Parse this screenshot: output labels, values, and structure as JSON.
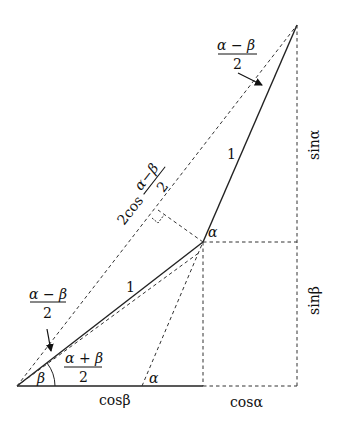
{
  "diagram": {
    "type": "trigonometric-sum-to-product",
    "points": {
      "origin": [
        17,
        386
      ],
      "mid": [
        203,
        242
      ],
      "top": [
        297,
        25
      ],
      "foot_mid": [
        203,
        386
      ],
      "foot_top": [
        297,
        386
      ],
      "alpha_foot": [
        142,
        386
      ],
      "right_angle": [
        158,
        218
      ]
    },
    "labels": {
      "seg_one_lower": "1",
      "seg_one_upper": "1",
      "beta": "β",
      "alpha_mid": "α",
      "alpha_base": "α",
      "cos_beta": "cosβ",
      "cos_alpha": "cosα",
      "sin_alpha": "sinα",
      "sin_beta": "sinβ",
      "two_cos": "2cos",
      "frac_amb_num": "α − β",
      "frac_den": "2",
      "frac_apb_num": "α + β",
      "top_frac_num": "α − β",
      "top_frac_den": "2",
      "left_frac_num": "α − β",
      "left_frac_den": "2",
      "diag_frac_num": "α−β",
      "diag_frac_den": "2"
    }
  }
}
